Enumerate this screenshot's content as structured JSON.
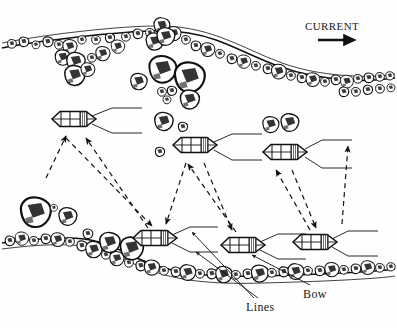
{
  "figure": {
    "title_visible": false,
    "type": "line-art-diagram",
    "background_color": "#ffffff",
    "ink_color": "#111111"
  },
  "labels": {
    "current": "CURRENT",
    "lines": "Lines",
    "bow": "Bow"
  },
  "current_arrow": {
    "direction": "right",
    "x1": 318,
    "y1": 40,
    "x2": 358,
    "y2": 40
  },
  "banks": {
    "top": {
      "name": "upper-rocky-bank",
      "description": "irregular boulder-strewn shoreline running left to right across the top"
    },
    "bottom": {
      "name": "lower-rocky-bank",
      "description": "irregular boulder-strewn shoreline running left to right across the bottom"
    }
  },
  "boats": [
    {
      "id": "boat-upper-left",
      "cx": 74,
      "cy": 119,
      "rx": 22,
      "ry": 8
    },
    {
      "id": "boat-upper-mid",
      "cx": 195,
      "cy": 145,
      "rx": 22,
      "ry": 8
    },
    {
      "id": "boat-upper-right",
      "cx": 285,
      "cy": 152,
      "rx": 22,
      "ry": 8
    },
    {
      "id": "boat-lower-left",
      "cx": 155,
      "cy": 238,
      "rx": 22,
      "ry": 8
    },
    {
      "id": "boat-lower-mid",
      "cx": 243,
      "cy": 245,
      "rx": 22,
      "ry": 8
    },
    {
      "id": "boat-lower-right",
      "cx": 315,
      "cy": 242,
      "rx": 22,
      "ry": 8
    }
  ],
  "movement_arrows": [
    {
      "from": "boat-lower-left",
      "to": "boat-upper-left",
      "style": "dashed"
    },
    {
      "from": "boat-lower-left",
      "to": "boat-upper-left",
      "style": "dashed"
    },
    {
      "from": "boat-upper-left",
      "to": "boat-lower-left",
      "style": "dashed"
    },
    {
      "from": "boat-lower-mid",
      "to": "boat-upper-mid",
      "style": "dashed"
    },
    {
      "from": "boat-upper-mid",
      "to": "boat-lower-mid",
      "style": "dashed"
    },
    {
      "from": "boat-lower-right",
      "to": "boat-upper-right",
      "style": "dashed"
    },
    {
      "from": "boat-upper-right",
      "to": "boat-lower-right",
      "style": "dashed"
    }
  ],
  "rock_clusters": [
    {
      "name": "midstream-boulders",
      "count": 11
    },
    {
      "name": "right-pair-boulders",
      "count": 2
    },
    {
      "name": "lower-left-boulders",
      "count": 3
    }
  ]
}
